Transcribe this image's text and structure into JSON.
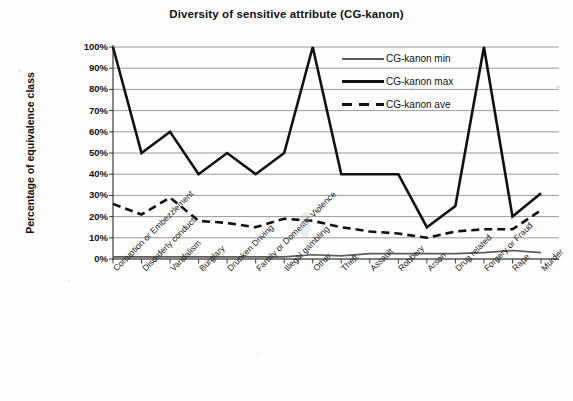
{
  "chart_data": {
    "type": "line",
    "title": "Diversity of sensitive attribute (CG-kanon)",
    "xlabel": "",
    "ylabel": "Percentage of equivalence class",
    "ylim": [
      0,
      100
    ],
    "ytick_labels": [
      "100%",
      "90%",
      "80%",
      "70%",
      "60%",
      "50%",
      "40%",
      "30%",
      "20%",
      "10%",
      "0%"
    ],
    "ytick_values": [
      100,
      90,
      80,
      70,
      60,
      50,
      40,
      30,
      20,
      10,
      0
    ],
    "grid": true,
    "legend_position": "upper-right-inside",
    "categories": [
      "Corruption or Embezzlement",
      "Disorderly conduct",
      "Vandalism",
      "Burglary",
      "Drunken Driving",
      "Family or Domestic Violence",
      "Illegal gambling",
      "Other",
      "Theft",
      "Assault",
      "Robbery",
      "Arson",
      "Drug related",
      "Forgery or Fraud",
      "Rape",
      "Murder"
    ],
    "series": [
      {
        "name": "CG-kanon min",
        "style": "thin-solid",
        "color": "#5a5a5a",
        "values": [
          1,
          1,
          1,
          1,
          1,
          1,
          1,
          2,
          1.5,
          2.5,
          2.5,
          2.5,
          2.5,
          3,
          4,
          3
        ]
      },
      {
        "name": "CG-kanon max",
        "style": "thick-solid",
        "color": "#111111",
        "values": [
          100,
          50,
          60,
          40,
          50,
          40,
          50,
          100,
          40,
          40,
          40,
          15,
          25,
          100,
          20,
          31
        ]
      },
      {
        "name": "CG-kanon ave",
        "style": "dashed",
        "color": "#111111",
        "values": [
          26,
          21,
          29,
          18,
          17,
          15,
          19,
          18,
          15,
          13,
          12,
          10,
          13,
          14,
          14,
          23
        ]
      }
    ]
  }
}
